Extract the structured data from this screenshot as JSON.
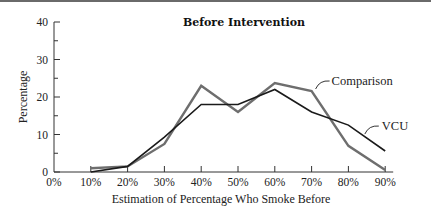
{
  "chart_data": {
    "type": "line",
    "title": "Before Intervention",
    "xlabel": "Estimation of Percentage Who Smoke Before",
    "ylabel": "Percentage",
    "x": [
      "0%",
      "10%",
      "20%",
      "30%",
      "40%",
      "50%",
      "60%",
      "70%",
      "80%",
      "90%"
    ],
    "x_ticks": [
      "0%",
      "10%",
      "20%",
      "30%",
      "40%",
      "50%",
      "60%",
      "70%",
      "80%",
      "90%"
    ],
    "y_ticks": [
      0,
      10,
      20,
      30,
      40
    ],
    "ylim": [
      0,
      40
    ],
    "grid": false,
    "legend_position": "inline labels at right",
    "series": [
      {
        "name": "Comparison",
        "color": "#6e6e6e",
        "x": [
          "10%",
          "20%",
          "30%",
          "40%",
          "50%",
          "60%",
          "70%",
          "80%",
          "90%"
        ],
        "values": [
          1,
          1.5,
          7.5,
          23,
          16,
          23.7,
          21.6,
          7,
          0.5
        ]
      },
      {
        "name": "VCU",
        "color": "#1a1a1a",
        "x": [
          "10%",
          "20%",
          "30%",
          "40%",
          "50%",
          "60%",
          "70%",
          "80%",
          "90%"
        ],
        "values": [
          0,
          1.5,
          9.3,
          18,
          18,
          22,
          16,
          12.5,
          5.6
        ]
      }
    ]
  }
}
